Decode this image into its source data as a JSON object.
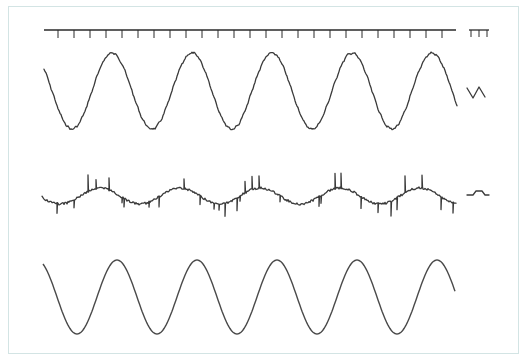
{
  "figure": {
    "description": "Three stacked waveform recordings with a time-marker axis and calibration marks",
    "colors": {
      "frame": "#d3e4e4",
      "trace": "#3a3a3a",
      "background": "#ffffff"
    }
  },
  "time_axis": {
    "y": 30,
    "x_start": 44,
    "x_end": 456,
    "tick_start": 58,
    "tick_spacing": 16,
    "tick_count": 25,
    "tick_length": 8,
    "calibration_ticks": {
      "x": [
        471,
        479,
        487
      ],
      "top": 30,
      "length": 7
    }
  },
  "traces": [
    {
      "name": "trace-top-irregular-sine",
      "center_y": 91,
      "amplitude": 38,
      "period_px": 80,
      "x_start": 44,
      "x_end": 457,
      "phase_trough_x": 72,
      "noise": "small wobble",
      "calibration_mark": {
        "shape": "v-zigzag",
        "points": [
          [
            467,
            88
          ],
          [
            473,
            98
          ],
          [
            479,
            87
          ],
          [
            485,
            97
          ]
        ]
      }
    },
    {
      "name": "trace-middle-noisy-spiked",
      "center_y": 196,
      "amplitude": 8,
      "period_px": 80,
      "x_start": 42,
      "x_end": 456,
      "phase_trough_x": 60,
      "noise": "sharp vertical spikes",
      "calibration_mark": {
        "shape": "step-pulse",
        "points": [
          [
            467,
            195
          ],
          [
            473,
            195
          ],
          [
            476,
            191
          ],
          [
            482,
            191
          ],
          [
            485,
            195
          ],
          [
            489,
            195
          ]
        ]
      }
    },
    {
      "name": "trace-bottom-clean-sine",
      "center_y": 297,
      "amplitude": 37,
      "period_px": 80,
      "x_start": 43,
      "x_end": 455,
      "phase_trough_x": 77,
      "noise": "none"
    }
  ]
}
